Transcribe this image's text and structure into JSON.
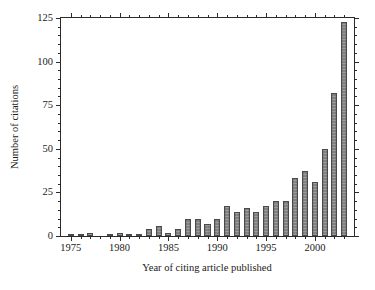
{
  "chart_data": {
    "type": "bar",
    "title": "",
    "xlabel": "Year of citing article published",
    "ylabel": "Number of citations",
    "xlim": [
      1974,
      2004
    ],
    "ylim": [
      0,
      125
    ],
    "ytick_labels": [
      "0",
      "25",
      "50",
      "75",
      "100",
      "125"
    ],
    "ytick_values": [
      0,
      25,
      50,
      75,
      100,
      125
    ],
    "yminor_step": 5,
    "xtick_labels": [
      "1975",
      "1980",
      "1985",
      "1990",
      "1995",
      "2000"
    ],
    "xtick_values": [
      1975,
      1980,
      1985,
      1990,
      1995,
      2000
    ],
    "xminor_step": 1,
    "grid": false,
    "legend": false,
    "bar_color": "#838383",
    "bar_edge_color": "#4a4a4a",
    "axis_color": "#2b2b2b",
    "background": "#ffffff",
    "categories": [
      1975,
      1976,
      1977,
      1978,
      1979,
      1980,
      1981,
      1982,
      1983,
      1984,
      1985,
      1986,
      1987,
      1988,
      1989,
      1990,
      1991,
      1992,
      1993,
      1994,
      1995,
      1996,
      1997,
      1998,
      1999,
      2000,
      2001,
      2002,
      2003
    ],
    "values": [
      1,
      1,
      2,
      0,
      1,
      2,
      1,
      1,
      4,
      6,
      2,
      4,
      10,
      10,
      7,
      10,
      17,
      14,
      16,
      14,
      17,
      20,
      20,
      33,
      37,
      31,
      50,
      82,
      123
    ]
  }
}
